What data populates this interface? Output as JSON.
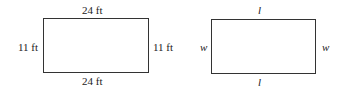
{
  "figures": [
    {
      "name": "numeric-rectangle",
      "top_label": "24 ft",
      "bottom_label": "24 ft",
      "left_label": "11 ft",
      "right_label": "11 ft"
    },
    {
      "name": "variable-rectangle",
      "top_label": "l",
      "bottom_label": "l",
      "left_label": "w",
      "right_label": "w"
    }
  ]
}
